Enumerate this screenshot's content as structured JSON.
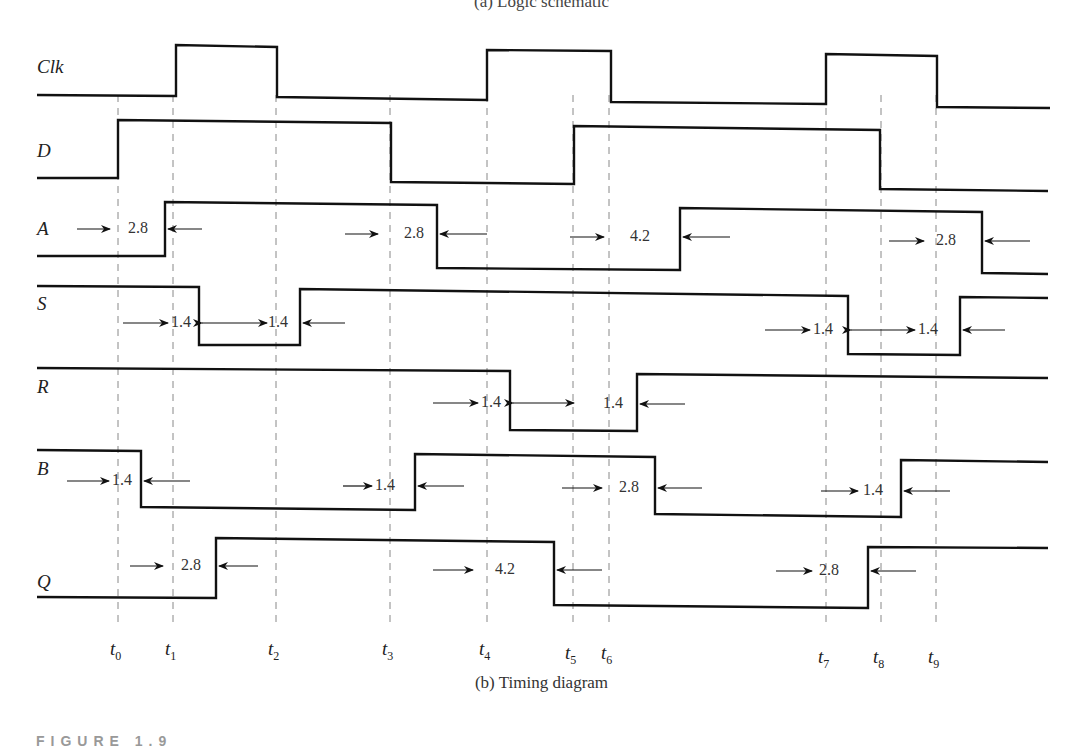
{
  "captions": {
    "top": "(a) Logic schematic",
    "bottom": "(b) Timing diagram",
    "figure": "FIGURE 1.9"
  },
  "style": {
    "signal_color": "#111111",
    "guide_color": "#888888",
    "arrow_color": "#111111"
  },
  "time_markers": [
    {
      "label": "t",
      "sub": "0",
      "x": 118
    },
    {
      "label": "t",
      "sub": "1",
      "x": 173
    },
    {
      "label": "t",
      "sub": "2",
      "x": 276
    },
    {
      "label": "t",
      "sub": "3",
      "x": 390
    },
    {
      "label": "t",
      "sub": "4",
      "x": 487
    },
    {
      "label": "t",
      "sub": "5",
      "x": 573
    },
    {
      "label": "t",
      "sub": "6",
      "x": 609
    },
    {
      "label": "t",
      "sub": "7",
      "x": 826
    },
    {
      "label": "t",
      "sub": "8",
      "x": 881
    },
    {
      "label": "t",
      "sub": "9",
      "x": 936
    }
  ],
  "signals": [
    {
      "name": "Clk",
      "label_y": 68,
      "points": [
        [
          37,
          95
        ],
        [
          176,
          96
        ],
        [
          176,
          45
        ],
        [
          277,
          47
        ],
        [
          277,
          97
        ],
        [
          487,
          100
        ],
        [
          487,
          50
        ],
        [
          611,
          51
        ],
        [
          611,
          102
        ],
        [
          826,
          104
        ],
        [
          826,
          54
        ],
        [
          937,
          56
        ],
        [
          937,
          107
        ],
        [
          1050,
          108
        ]
      ]
    },
    {
      "name": "D",
      "label_y": 152,
      "points": [
        [
          37,
          178
        ],
        [
          118,
          178
        ],
        [
          118,
          120
        ],
        [
          391,
          123
        ],
        [
          391,
          182
        ],
        [
          574,
          184
        ],
        [
          574,
          126
        ],
        [
          880,
          130
        ],
        [
          880,
          189
        ],
        [
          1048,
          191
        ]
      ]
    },
    {
      "name": "A",
      "label_y": 230,
      "points": [
        [
          37,
          256
        ],
        [
          165,
          256
        ],
        [
          165,
          202
        ],
        [
          437,
          205
        ],
        [
          437,
          268
        ],
        [
          680,
          270
        ],
        [
          680,
          208
        ],
        [
          982,
          212
        ],
        [
          982,
          273
        ],
        [
          1048,
          274
        ]
      ]
    },
    {
      "name": "S",
      "label_y": 305,
      "points": [
        [
          37,
          286
        ],
        [
          199,
          287
        ],
        [
          199,
          345
        ],
        [
          300,
          345
        ],
        [
          300,
          289
        ],
        [
          848,
          296
        ],
        [
          848,
          354
        ],
        [
          960,
          355
        ],
        [
          960,
          297
        ],
        [
          1048,
          298
        ]
      ]
    },
    {
      "name": "R",
      "label_y": 388,
      "points": [
        [
          37,
          368
        ],
        [
          510,
          371
        ],
        [
          510,
          430
        ],
        [
          637,
          431
        ],
        [
          637,
          374
        ],
        [
          1048,
          378
        ]
      ]
    },
    {
      "name": "B",
      "label_y": 470,
      "points": [
        [
          37,
          450
        ],
        [
          141,
          451
        ],
        [
          141,
          507
        ],
        [
          415,
          510
        ],
        [
          415,
          454
        ],
        [
          655,
          457
        ],
        [
          655,
          514
        ],
        [
          901,
          517
        ],
        [
          901,
          460
        ],
        [
          1048,
          462
        ]
      ]
    },
    {
      "name": "Q",
      "label_y": 583,
      "points": [
        [
          37,
          597
        ],
        [
          216,
          598
        ],
        [
          216,
          538
        ],
        [
          554,
          542
        ],
        [
          554,
          605
        ],
        [
          868,
          608
        ],
        [
          868,
          547
        ],
        [
          1048,
          548
        ]
      ]
    }
  ],
  "delays": [
    {
      "signal": "A",
      "value": "2.8",
      "y": 229,
      "text_x": 128,
      "left_arrow": [
        77,
        110
      ],
      "right_arrow": [
        168,
        202
      ]
    },
    {
      "signal": "A",
      "value": "2.8",
      "y": 234,
      "text_x": 404,
      "left_arrow": [
        345,
        378
      ],
      "right_arrow": [
        440,
        487
      ]
    },
    {
      "signal": "A",
      "value": "4.2",
      "y": 237,
      "text_x": 630,
      "left_arrow": [
        570,
        604
      ],
      "right_arrow": [
        683,
        730
      ]
    },
    {
      "signal": "A",
      "value": "2.8",
      "y": 241,
      "text_x": 936,
      "left_arrow": [
        889,
        924
      ],
      "right_arrow": [
        985,
        1030
      ]
    },
    {
      "signal": "S",
      "value": "1.4",
      "y": 323,
      "text_x": 171,
      "left_arrow": [
        123,
        168
      ],
      "right_arrow_double": [
        202,
        267
      ]
    },
    {
      "signal": "S",
      "value": "1.4",
      "y": 323,
      "text_x": 268,
      "right_arrow": [
        303,
        345
      ]
    },
    {
      "signal": "S",
      "value": "1.4",
      "y": 330,
      "text_x": 813,
      "left_arrow": [
        765,
        810
      ],
      "right_arrow_double": [
        851,
        915
      ]
    },
    {
      "signal": "S",
      "value": "1.4",
      "y": 330,
      "text_x": 918,
      "right_arrow": [
        963,
        1005
      ]
    },
    {
      "signal": "R",
      "value": "1.4",
      "y": 403,
      "text_x": 481,
      "left_arrow": [
        433,
        478
      ],
      "right_arrow_double": [
        513,
        574
      ]
    },
    {
      "signal": "R",
      "value": "1.4",
      "y": 404,
      "text_x": 603,
      "right_arrow": [
        640,
        685
      ]
    },
    {
      "signal": "B",
      "value": "1.4",
      "y": 481,
      "text_x": 112,
      "left_arrow": [
        67,
        109
      ],
      "right_arrow": [
        144,
        190
      ]
    },
    {
      "signal": "B",
      "value": "1.4",
      "y": 486,
      "text_x": 375,
      "left_arrow": [
        343,
        372
      ],
      "right_arrow": [
        418,
        464
      ]
    },
    {
      "signal": "B",
      "value": "2.8",
      "y": 488,
      "text_x": 619,
      "left_arrow": [
        562,
        602
      ],
      "right_arrow": [
        658,
        702
      ]
    },
    {
      "signal": "B",
      "value": "1.4",
      "y": 491,
      "text_x": 863,
      "left_arrow": [
        821,
        858
      ],
      "right_arrow": [
        904,
        950
      ]
    },
    {
      "signal": "Q",
      "value": "2.8",
      "y": 566,
      "text_x": 181,
      "left_arrow": [
        130,
        163
      ],
      "right_arrow": [
        219,
        258
      ]
    },
    {
      "signal": "Q",
      "value": "4.2",
      "y": 570,
      "text_x": 495,
      "left_arrow": [
        433,
        473
      ],
      "right_arrow": [
        557,
        602
      ]
    },
    {
      "signal": "Q",
      "value": "2.8",
      "y": 571,
      "text_x": 819,
      "left_arrow": [
        776,
        812
      ],
      "right_arrow": [
        871,
        916
      ]
    }
  ]
}
